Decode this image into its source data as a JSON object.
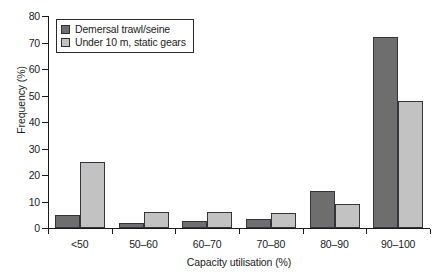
{
  "chart_data": {
    "type": "bar",
    "title": "",
    "xlabel": "Capacity utilisation (%)",
    "ylabel": "Frequency (%)",
    "categories": [
      "<50",
      "50–60",
      "60–70",
      "70–80",
      "80–90",
      "90–100"
    ],
    "series": [
      {
        "name": "Demersal trawl/seine",
        "color": "#6e6e6e",
        "values": [
          5,
          2,
          2.5,
          3.5,
          14,
          72
        ]
      },
      {
        "name": "Under 10 m, static gears",
        "color": "#c2c2c2",
        "values": [
          25,
          6,
          6,
          5.5,
          9,
          48
        ]
      }
    ],
    "ylim": [
      0,
      80
    ],
    "yticks": [
      0,
      10,
      20,
      30,
      40,
      50,
      60,
      70,
      80
    ],
    "ytick_labels": [
      "0",
      "10",
      "20",
      "30",
      "40",
      "50",
      "60",
      "70",
      "80"
    ],
    "grid": false,
    "legend_position": "top-left",
    "legend_entries": [
      "Demersal trawl/seine",
      "Under 10 m, static gears"
    ]
  }
}
